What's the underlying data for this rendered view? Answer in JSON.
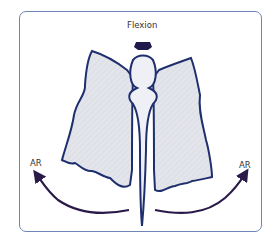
{
  "figure": {
    "top_label": "Flexion",
    "left_label": "AR",
    "right_label": "AR"
  },
  "colors": {
    "frame": "#6f86b4",
    "outline": "#1f2f6e",
    "fill": "#e2e4ea",
    "arrow": "#2a1a4a"
  }
}
